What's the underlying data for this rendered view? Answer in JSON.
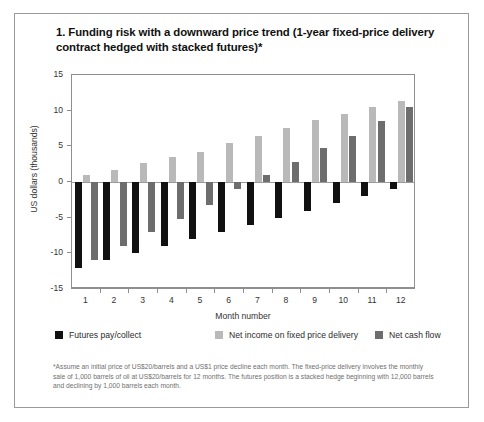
{
  "figure": {
    "title": "1. Funding risk with a downward price trend (1-year fixed-price delivery contract hedged with stacked futures)*",
    "footnote": "*Assume an initial price of US$20/barrels and a US$1 price decline each month. The fixed-price delivery involves the monthly sale of 1,000 barrels of oil at US$20/barrels for 12 months. The futures position is a stacked hedge beginning with 12,000 barrels and declining by 1,000 barrels each month."
  },
  "colors": {
    "futures": "#111111",
    "net_income": "#b9b9b9",
    "net_cash_flow": "#6d6d6d",
    "axis": "#8f8f8f",
    "frame": "#9a9a9a"
  },
  "chart_data": {
    "type": "bar",
    "title": "1. Funding risk with a downward price trend (1-year fixed-price delivery contract hedged with stacked futures)*",
    "xlabel": "Month number",
    "ylabel": "US dollars (thousands)",
    "categories": [
      "1",
      "2",
      "3",
      "4",
      "5",
      "6",
      "7",
      "8",
      "9",
      "10",
      "11",
      "12"
    ],
    "ylim": [
      -15,
      15
    ],
    "yticks": [
      15,
      10,
      5,
      0,
      -5,
      -10,
      -15
    ],
    "ytick_labels": [
      "15",
      "10",
      "5",
      "0",
      "-5",
      "-10",
      "-15"
    ],
    "grid": false,
    "legend_position": "bottom",
    "series": [
      {
        "name": "Futures pay/collect",
        "color": "#111111",
        "values": [
          -12,
          -11,
          -10,
          -9,
          -8,
          -7,
          -6,
          -5,
          -4,
          -3,
          -2,
          -1
        ]
      },
      {
        "name": "Net income on fixed price delivery",
        "color": "#b9b9b9",
        "values": [
          1.0,
          1.7,
          2.6,
          3.5,
          4.2,
          5.5,
          6.5,
          7.6,
          8.7,
          9.5,
          10.5,
          11.4
        ]
      },
      {
        "name": "Net cash flow",
        "color": "#6d6d6d",
        "values": [
          -11.0,
          -9.0,
          -7.0,
          -5.2,
          -3.2,
          -1.0,
          1.0,
          2.8,
          4.7,
          6.5,
          8.5,
          10.5
        ]
      }
    ]
  }
}
